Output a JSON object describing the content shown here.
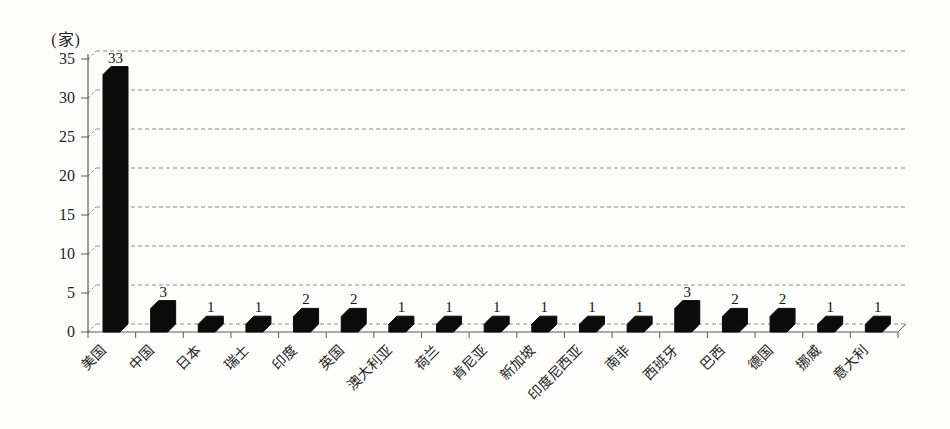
{
  "chart_data": {
    "type": "bar",
    "style": "3d-black-columns-on-white",
    "title": "",
    "ylabel": "(家)",
    "xlabel": "",
    "categories": [
      "美国",
      "中国",
      "日本",
      "瑞士",
      "印度",
      "英国",
      "澳大利亚",
      "荷兰",
      "肯尼亚",
      "新加坡",
      "印度尼西亚",
      "南非",
      "西班牙",
      "巴西",
      "德国",
      "挪威",
      "意大利"
    ],
    "values": [
      33,
      3,
      1,
      1,
      2,
      2,
      1,
      1,
      1,
      1,
      1,
      1,
      3,
      2,
      2,
      1,
      1
    ],
    "data_labels": [
      33,
      3,
      1,
      1,
      2,
      2,
      1,
      1,
      1,
      1,
      1,
      1,
      3,
      2,
      2,
      1,
      1
    ],
    "yticks": [
      0,
      5,
      10,
      15,
      20,
      25,
      30,
      35
    ],
    "ylim": [
      0,
      35
    ],
    "grid": "horizontal-dashed",
    "legend": "none",
    "colors": {
      "bar": "#0b0b0b",
      "grid_line": "#8f8f8f",
      "axis_line": "#5a5a5a",
      "text": "#1f1f1f",
      "background": "#fdfdfc"
    }
  }
}
